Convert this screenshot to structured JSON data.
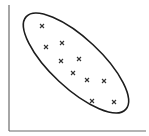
{
  "chart_data": {
    "type": "scatter",
    "title": "",
    "xlabel": "",
    "ylabel": "",
    "grid": false,
    "legend": null,
    "marker": "x",
    "annotations": [
      {
        "type": "ellipse",
        "description": "enclosing ellipse around all points, oriented along negative correlation",
        "center_px": [
          76,
          63
        ],
        "rx_px": 68,
        "ry_px": 25,
        "rotation_deg": 43
      }
    ],
    "axes": {
      "x_axis": {
        "from_px": [
          9,
          131
        ],
        "to_px": [
          146,
          131
        ]
      },
      "y_axis": {
        "from_px": [
          9,
          5
        ],
        "to_px": [
          9,
          131
        ]
      }
    },
    "points_px": [
      {
        "x": 42,
        "y": 26
      },
      {
        "x": 46,
        "y": 47
      },
      {
        "x": 62,
        "y": 43
      },
      {
        "x": 61,
        "y": 61
      },
      {
        "x": 79,
        "y": 59
      },
      {
        "x": 73,
        "y": 73
      },
      {
        "x": 87,
        "y": 80
      },
      {
        "x": 104,
        "y": 81
      },
      {
        "x": 92,
        "y": 101
      },
      {
        "x": 114,
        "y": 102
      }
    ],
    "x": [
      1.0,
      1.3,
      2.0,
      2.0,
      2.7,
      2.4,
      3.1,
      3.8,
      3.3,
      4.3
    ],
    "y": [
      4.3,
      3.4,
      3.6,
      2.8,
      2.9,
      2.3,
      2.0,
      2.0,
      1.1,
      1.1
    ],
    "correlation": "negative"
  },
  "colors": {
    "axis": "#6b6b6b",
    "ellipse": "#1c1c1c",
    "marker": "#333333",
    "background": "#ffffff"
  }
}
